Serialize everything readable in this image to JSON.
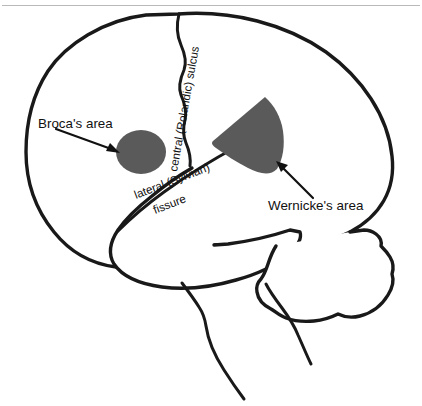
{
  "figure": {
    "background_color": "#ffffff",
    "outline_color": "#191919",
    "region_fill_color": "#5a5a5a",
    "rule_color": "#b9b9b9"
  },
  "labels": {
    "broca": "Broca's area",
    "wernicke": "Wernicke's area",
    "central_sulcus": "central (Rolandic) sulcus",
    "lateral_fissure_line1": "lateral (Sylvian)",
    "lateral_fissure_line2": "fissure"
  },
  "regions": [
    {
      "name": "broca-area",
      "label": "Broca's area",
      "shape": "ellipse",
      "fill": "#5a5a5a",
      "center": [
        141,
        152
      ],
      "radius": [
        25,
        22
      ]
    },
    {
      "name": "wernicke-area",
      "label": "Wernicke's area",
      "shape": "wedge",
      "fill": "#5a5a5a",
      "apex": [
        263,
        98
      ],
      "extent": [
        212,
        177
      ]
    }
  ],
  "anatomy": [
    {
      "name": "cerebrum-outline",
      "label": "cerebrum"
    },
    {
      "name": "temporal-lobe-outline",
      "label": "temporal lobe"
    },
    {
      "name": "cerebellum-outline",
      "label": "cerebellum"
    },
    {
      "name": "brainstem-outline",
      "label": "brainstem"
    },
    {
      "name": "central-sulcus-line",
      "label": "central (Rolandic) sulcus"
    },
    {
      "name": "lateral-fissure-line",
      "label": "lateral (Sylvian) fissure"
    }
  ],
  "annotations": [
    {
      "name": "broca-leader",
      "label": "Broca's area leader line",
      "from": [
        56,
        129
      ],
      "to": [
        119,
        152
      ]
    },
    {
      "name": "wernicke-leader",
      "label": "Wernicke's area leader line",
      "from": [
        312,
        197
      ],
      "to": [
        277,
        162
      ]
    }
  ]
}
